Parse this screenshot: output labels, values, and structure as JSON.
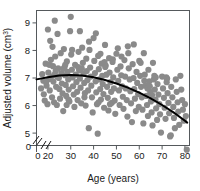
{
  "chart_data": {
    "type": "scatter",
    "title": "",
    "xlabel": "Age (years)",
    "ylabel": "Adjusted volume (cm³)",
    "ylabel_base": "Adjusted volume (cm",
    "ylabel_sup": "3",
    "ylabel_close": ")",
    "xlim": [
      15,
      82
    ],
    "ylim": [
      4.55,
      9.45
    ],
    "grid": false,
    "legend": "none",
    "axis_break": {
      "x_axis": true,
      "y_axis": true,
      "style": "double-slash"
    },
    "xticks": [
      0,
      20,
      30,
      40,
      50,
      60,
      70,
      80
    ],
    "xtick_labels": [
      "0",
      "20",
      "30",
      "40",
      "50",
      "60",
      "70",
      "80"
    ],
    "yticks": [
      0,
      5,
      6,
      7,
      8,
      9
    ],
    "ytick_labels": [
      "0",
      "5",
      "6",
      "7",
      "8",
      "9"
    ],
    "origin_label": "0",
    "marker": {
      "shape": "circle",
      "color": "#8a8a8a",
      "size": 3.1
    },
    "trend": {
      "name": "fitted quadratic trend",
      "color": "#000000",
      "x": [
        15,
        20,
        25,
        30,
        35,
        40,
        45,
        50,
        55,
        60,
        65,
        70,
        75,
        80,
        81
      ],
      "y": [
        6.95,
        7.03,
        7.09,
        7.11,
        7.09,
        7.03,
        6.93,
        6.8,
        6.65,
        6.47,
        6.26,
        6.02,
        5.75,
        5.45,
        5.38
      ]
    },
    "points": [
      [
        17.0,
        6.62
      ],
      [
        17.5,
        7.14
      ],
      [
        18.0,
        6.9
      ],
      [
        18.2,
        6.41
      ],
      [
        18.6,
        6.18
      ],
      [
        19.0,
        7.52
      ],
      [
        19.4,
        6.72
      ],
      [
        19.8,
        6.05
      ],
      [
        20.0,
        8.76
      ],
      [
        20.2,
        7.2
      ],
      [
        20.5,
        6.96
      ],
      [
        20.8,
        6.55
      ],
      [
        21.0,
        8.35
      ],
      [
        21.3,
        7.66
      ],
      [
        21.5,
        7.05
      ],
      [
        21.8,
        6.3
      ],
      [
        22.0,
        8.13
      ],
      [
        22.2,
        7.43
      ],
      [
        22.4,
        6.87
      ],
      [
        22.7,
        6.12
      ],
      [
        23.0,
        9.08
      ],
      [
        23.2,
        7.78
      ],
      [
        23.4,
        7.25
      ],
      [
        23.6,
        6.68
      ],
      [
        23.9,
        6.02
      ],
      [
        24.2,
        8.6
      ],
      [
        24.5,
        7.35
      ],
      [
        24.8,
        7.0
      ],
      [
        25.0,
        6.6
      ],
      [
        25.3,
        6.25
      ],
      [
        25.6,
        7.9
      ],
      [
        25.9,
        7.18
      ],
      [
        26.1,
        6.8
      ],
      [
        26.4,
        6.44
      ],
      [
        26.7,
        5.8
      ],
      [
        27.0,
        8.05
      ],
      [
        27.3,
        7.4
      ],
      [
        27.5,
        7.1
      ],
      [
        27.8,
        6.75
      ],
      [
        28.0,
        6.35
      ],
      [
        28.3,
        7.6
      ],
      [
        28.6,
        7.22
      ],
      [
        28.9,
        6.95
      ],
      [
        29.1,
        6.58
      ],
      [
        29.4,
        6.15
      ],
      [
        29.7,
        8.7
      ],
      [
        30.0,
        9.22
      ],
      [
        30.2,
        7.85
      ],
      [
        30.5,
        7.3
      ],
      [
        30.8,
        7.02
      ],
      [
        31.0,
        6.7
      ],
      [
        31.3,
        6.4
      ],
      [
        31.6,
        5.95
      ],
      [
        31.9,
        7.48
      ],
      [
        32.2,
        7.12
      ],
      [
        32.5,
        6.85
      ],
      [
        32.8,
        6.5
      ],
      [
        33.0,
        6.2
      ],
      [
        33.4,
        7.95
      ],
      [
        33.7,
        7.28
      ],
      [
        34.0,
        6.98
      ],
      [
        34.3,
        6.65
      ],
      [
        34.6,
        6.08
      ],
      [
        35.0,
        8.1
      ],
      [
        35.3,
        7.55
      ],
      [
        35.6,
        7.15
      ],
      [
        35.9,
        6.82
      ],
      [
        36.2,
        6.45
      ],
      [
        36.5,
        6.0
      ],
      [
        36.8,
        7.7
      ],
      [
        37.0,
        7.25
      ],
      [
        37.3,
        6.92
      ],
      [
        37.6,
        6.55
      ],
      [
        37.9,
        5.18
      ],
      [
        38.2,
        8.02
      ],
      [
        38.5,
        7.38
      ],
      [
        38.8,
        7.05
      ],
      [
        39.0,
        6.72
      ],
      [
        39.3,
        6.3
      ],
      [
        39.6,
        5.75
      ],
      [
        40.0,
        8.45
      ],
      [
        40.3,
        7.62
      ],
      [
        40.6,
        7.18
      ],
      [
        40.9,
        6.88
      ],
      [
        41.2,
        6.48
      ],
      [
        41.5,
        6.05
      ],
      [
        41.8,
        4.98
      ],
      [
        42.0,
        7.8
      ],
      [
        42.3,
        7.32
      ],
      [
        42.6,
        6.95
      ],
      [
        42.9,
        6.6
      ],
      [
        43.2,
        6.22
      ],
      [
        43.5,
        7.52
      ],
      [
        43.8,
        7.08
      ],
      [
        44.0,
        6.78
      ],
      [
        44.3,
        6.42
      ],
      [
        44.6,
        5.92
      ],
      [
        45.0,
        8.2
      ],
      [
        45.3,
        7.45
      ],
      [
        45.6,
        7.12
      ],
      [
        45.9,
        6.68
      ],
      [
        46.2,
        6.28
      ],
      [
        46.5,
        5.82
      ],
      [
        46.8,
        7.72
      ],
      [
        47.0,
        7.2
      ],
      [
        47.4,
        6.85
      ],
      [
        47.7,
        6.5
      ],
      [
        48.0,
        6.1
      ],
      [
        48.3,
        7.58
      ],
      [
        48.6,
        7.02
      ],
      [
        48.9,
        6.62
      ],
      [
        49.2,
        6.18
      ],
      [
        49.5,
        5.7
      ],
      [
        50.0,
        7.88
      ],
      [
        50.4,
        7.3
      ],
      [
        50.8,
        6.9
      ],
      [
        51.1,
        6.55
      ],
      [
        51.4,
        6.02
      ],
      [
        51.8,
        7.42
      ],
      [
        52.1,
        7.1
      ],
      [
        52.5,
        6.7
      ],
      [
        52.8,
        6.32
      ],
      [
        53.1,
        5.88
      ],
      [
        53.5,
        7.65
      ],
      [
        53.8,
        7.05
      ],
      [
        54.1,
        6.62
      ],
      [
        54.5,
        6.2
      ],
      [
        54.8,
        5.6
      ],
      [
        55.0,
        8.15
      ],
      [
        55.4,
        7.35
      ],
      [
        55.8,
        6.95
      ],
      [
        56.1,
        6.52
      ],
      [
        56.4,
        6.08
      ],
      [
        56.8,
        5.4
      ],
      [
        57.1,
        7.5
      ],
      [
        57.5,
        7.0
      ],
      [
        57.8,
        6.6
      ],
      [
        58.1,
        6.25
      ],
      [
        58.5,
        5.8
      ],
      [
        58.8,
        7.22
      ],
      [
        59.1,
        6.82
      ],
      [
        59.5,
        6.42
      ],
      [
        59.8,
        5.95
      ],
      [
        60.0,
        7.62
      ],
      [
        60.4,
        7.08
      ],
      [
        60.8,
        6.68
      ],
      [
        61.1,
        6.3
      ],
      [
        61.4,
        5.85
      ],
      [
        61.8,
        5.35
      ],
      [
        62.0,
        7.9
      ],
      [
        62.4,
        7.12
      ],
      [
        62.8,
        6.72
      ],
      [
        63.1,
        6.35
      ],
      [
        63.4,
        6.02
      ],
      [
        63.8,
        5.62
      ],
      [
        64.0,
        7.3
      ],
      [
        64.4,
        6.88
      ],
      [
        64.8,
        6.5
      ],
      [
        65.1,
        6.15
      ],
      [
        65.4,
        5.75
      ],
      [
        65.8,
        5.28
      ],
      [
        66.0,
        7.55
      ],
      [
        66.4,
        6.95
      ],
      [
        66.8,
        6.58
      ],
      [
        67.1,
        6.22
      ],
      [
        67.4,
        5.9
      ],
      [
        67.8,
        5.48
      ],
      [
        68.0,
        6.78
      ],
      [
        68.4,
        6.4
      ],
      [
        68.8,
        6.05
      ],
      [
        69.1,
        5.68
      ],
      [
        69.5,
        5.02
      ],
      [
        70.0,
        7.05
      ],
      [
        70.4,
        6.62
      ],
      [
        70.8,
        6.28
      ],
      [
        71.1,
        5.92
      ],
      [
        71.5,
        5.52
      ],
      [
        72.0,
        6.85
      ],
      [
        72.4,
        6.45
      ],
      [
        72.8,
        6.1
      ],
      [
        73.1,
        5.72
      ],
      [
        73.5,
        4.88
      ],
      [
        73.8,
        4.92
      ],
      [
        74.0,
        6.68
      ],
      [
        74.5,
        6.3
      ],
      [
        74.9,
        5.95
      ],
      [
        75.2,
        5.55
      ],
      [
        75.6,
        5.18
      ],
      [
        76.0,
        6.95
      ],
      [
        76.4,
        6.5
      ],
      [
        76.8,
        6.12
      ],
      [
        77.1,
        5.78
      ],
      [
        77.5,
        5.3
      ],
      [
        78.0,
        7.08
      ],
      [
        78.4,
        6.58
      ],
      [
        78.8,
        6.2
      ],
      [
        79.1,
        5.85
      ],
      [
        79.5,
        5.45
      ],
      [
        80.0,
        6.05
      ],
      [
        80.4,
        5.62
      ],
      [
        80.8,
        4.4
      ],
      [
        62.2,
        6.9
      ],
      [
        63.6,
        6.62
      ],
      [
        64.6,
        6.7
      ],
      [
        65.6,
        6.38
      ],
      [
        44.8,
        7.58
      ],
      [
        45.1,
        7.4
      ],
      [
        26.9,
        7.34
      ],
      [
        27.6,
        7.48
      ],
      [
        33.2,
        7.4
      ],
      [
        34.8,
        7.35
      ],
      [
        24.0,
        7.05
      ],
      [
        22.9,
        7.12
      ],
      [
        19.2,
        6.85
      ],
      [
        20.6,
        7.48
      ],
      [
        71.8,
        7.02
      ],
      [
        72.2,
        6.98
      ],
      [
        57.6,
        8.22
      ],
      [
        52.2,
        7.78
      ],
      [
        48.4,
        7.68
      ],
      [
        41.0,
        8.62
      ],
      [
        34.0,
        8.7
      ],
      [
        30.6,
        8.02
      ],
      [
        38.0,
        8.32
      ],
      [
        50.6,
        8.08
      ],
      [
        55.2,
        7.9
      ],
      [
        60.6,
        7.55
      ],
      [
        66.6,
        7.08
      ],
      [
        67.2,
        7.02
      ],
      [
        43.0,
        7.88
      ],
      [
        28.2,
        6.02
      ],
      [
        29.0,
        6.22
      ],
      [
        36.0,
        6.3
      ],
      [
        42.2,
        6.12
      ],
      [
        47.2,
        6.05
      ]
    ]
  }
}
